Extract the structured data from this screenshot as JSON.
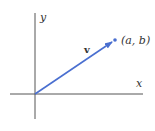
{
  "diagram": {
    "title": "",
    "axes": {
      "x_label": "x",
      "y_label": "y"
    },
    "vector": {
      "label": "v",
      "tail": "origin",
      "head_label": "(a, b)",
      "color": "#4a6fd0"
    },
    "axis_color": "#555555",
    "text_color": "#333333"
  }
}
